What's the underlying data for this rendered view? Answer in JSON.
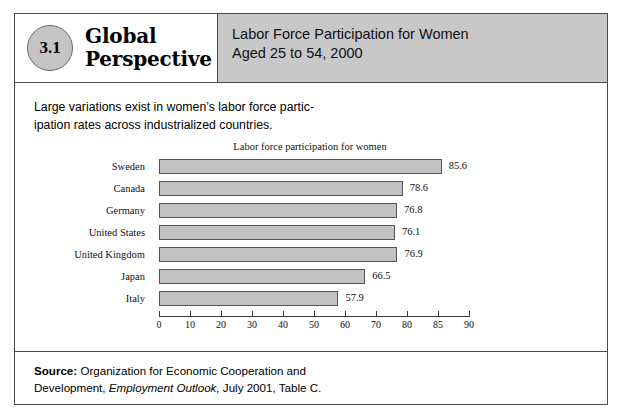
{
  "figure": {
    "badge_number": "3.1",
    "badge_title_line1": "Global",
    "badge_title_line2": "Perspective",
    "header_line1": "Labor Force Participation for Women",
    "header_line2": "Aged 25 to 54, 2000",
    "intro_line1": "Large variations exist in women’s labor force partic-",
    "intro_line2": "ipation rates across industrialized countries.",
    "source_label": "Source:",
    "source_line1_rest": " Organization for Economic Cooperation and",
    "source_line2_pre": "Development, ",
    "source_line2_italic": "Employment Outlook,",
    "source_line2_post": " July 2001, Table C."
  },
  "colors": {
    "header_band": "#c8c8c8",
    "badge_fill": "#c4c4c4",
    "bar_fill": "#c2c2c2",
    "bar_border": "#555555",
    "frame_border": "#4a4a4a"
  },
  "chart_data": {
    "type": "bar",
    "orientation": "horizontal",
    "title": "Labor force participation for women",
    "xlabel": "",
    "ylabel": "",
    "categories": [
      "Sweden",
      "Canada",
      "Germany",
      "United States",
      "United Kingdom",
      "Japan",
      "Italy"
    ],
    "values": [
      85.6,
      78.6,
      76.8,
      76.1,
      76.9,
      66.5,
      57.9
    ],
    "value_labels": [
      "85.6",
      "78.6",
      "76.8",
      "76.1",
      "76.9",
      "66.5",
      "57.9"
    ],
    "xlim": [
      0,
      90
    ],
    "tick_labels": [
      "0",
      "10",
      "20",
      "30",
      "40",
      "50",
      "60",
      "70",
      "80",
      "85",
      "90"
    ],
    "grid": false,
    "legend": null
  }
}
